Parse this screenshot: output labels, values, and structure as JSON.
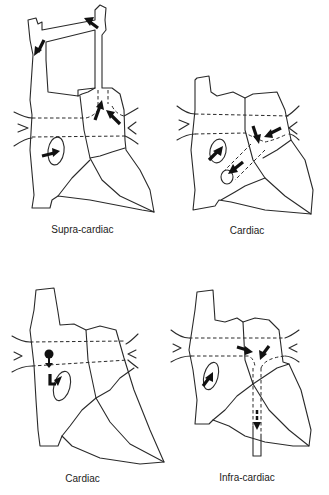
{
  "figure": {
    "panels": [
      {
        "id": "supra-cardiac",
        "caption": "Supra-cardiac",
        "position": "top-left"
      },
      {
        "id": "cardiac-1",
        "caption": "Cardiac",
        "position": "top-right"
      },
      {
        "id": "cardiac-2",
        "caption": "Cardiac",
        "position": "bottom-left"
      },
      {
        "id": "infra-cardiac",
        "caption": "Infra-cardiac",
        "position": "bottom-right"
      }
    ]
  }
}
